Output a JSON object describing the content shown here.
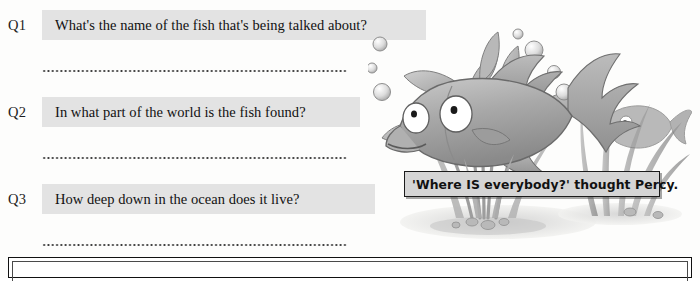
{
  "worksheet": {
    "questions": [
      {
        "number": "Q1",
        "text": "What's the name of the fish that's being talked about?",
        "band_width": 384,
        "top": 10,
        "answer_line_top": 70
      },
      {
        "number": "Q2",
        "text": "In what part of the world is the fish found?",
        "band_width": 318,
        "top": 97,
        "answer_line_top": 157
      },
      {
        "number": "Q3",
        "text": "How deep down in the ocean does it live?",
        "band_width": 333,
        "top": 184,
        "answer_line_top": 244
      }
    ],
    "band_color": "#e3e3e3",
    "text_color": "#111111"
  },
  "illustration": {
    "name": "underwater-fish-scene",
    "alt": "Grey cartoon fish with large eyes among seaweed and bubbles on the sea floor",
    "caption": "'Where IS everybody?' thought Percy.",
    "caption_box_width": 256,
    "character_name": "Percy"
  },
  "bottom_box": {
    "name": "answer-frame",
    "content": ""
  }
}
